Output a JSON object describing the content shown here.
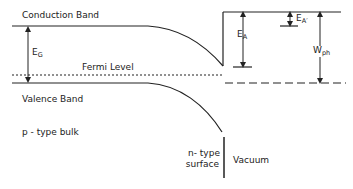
{
  "labels": {
    "conduction_band": "Conduction Band",
    "valence_band": "Valence Band",
    "fermi_level": "Fermi Level",
    "eg_main": "E",
    "eg_sub": "G",
    "ea_main": "E",
    "ea_sub": "A",
    "eap_main": "E",
    "eap_sub": "A′",
    "wph_main": "W",
    "wph_sub": "ph",
    "p_type_bulk": "p - type bulk",
    "n_type_line1": "n- type",
    "n_type_line2": "surface",
    "vacuum": "Vacuum"
  },
  "colors": {
    "line": "#222222",
    "background": "#ffffff"
  }
}
